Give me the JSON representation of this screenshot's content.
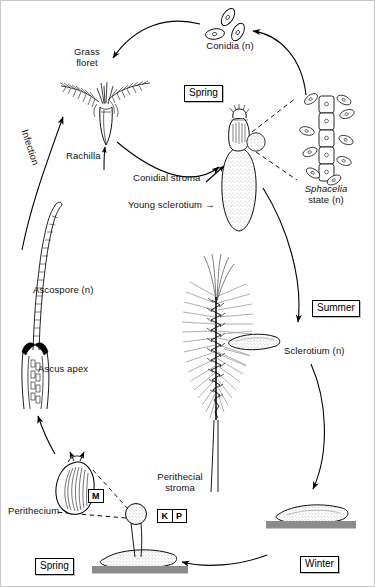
{
  "diagram": {
    "type": "biological-life-cycle",
    "colors": {
      "ink": "#000000",
      "soil_bar": "#8c8c8c",
      "stipple": "#ffffff",
      "awn_grey": "#9a9a9a",
      "background": "#ffffff"
    }
  },
  "seasons": [
    {
      "id": "spring-top",
      "label": "Spring",
      "x": 184,
      "y": 85
    },
    {
      "id": "summer",
      "label": "Summer",
      "x": 312,
      "y": 300
    },
    {
      "id": "winter",
      "label": "Winter",
      "x": 300,
      "y": 556
    },
    {
      "id": "spring-bottom",
      "label": "Spring",
      "x": 35,
      "y": 558
    }
  ],
  "labels": {
    "conidia": "Conidia (n)",
    "grass_floret": "Grass\nfloret",
    "rachilla": "Rachilla",
    "infection": "Infection",
    "conidial_stroma": "Conidial stroma",
    "young_sclerotium": "Young sclerotium",
    "sphacelia_genus": "Sphacelia",
    "sphacelia_state": "state (n)",
    "sclerotium": "Sclerotium (n)",
    "ascospore": "Ascospore (n)",
    "ascus_apex": "Ascus apex",
    "perithecium": "Perithecium",
    "perithecial_stroma": "Perithecial\nstroma"
  },
  "tags": {
    "meiosis": "M",
    "karyogamy": "K",
    "plasmogamy": "P"
  },
  "stages": [
    {
      "id": "conidia",
      "name": "Conidia (n)",
      "ploidy": "n",
      "season": "Spring"
    },
    {
      "id": "grass-floret",
      "name": "Grass floret",
      "ploidy": "",
      "season": "Spring"
    },
    {
      "id": "conidial-stroma",
      "name": "Conidial stroma",
      "ploidy": "",
      "season": "Spring"
    },
    {
      "id": "young-sclerotium",
      "name": "Young sclerotium",
      "ploidy": "",
      "season": "Spring"
    },
    {
      "id": "sphacelia-state",
      "name": "Sphacelia state (n)",
      "ploidy": "n",
      "season": "Spring"
    },
    {
      "id": "sclerotium",
      "name": "Sclerotium (n)",
      "ploidy": "n",
      "season": "Summer"
    },
    {
      "id": "overwintering",
      "name": "Sclerotium on soil",
      "ploidy": "n",
      "season": "Winter"
    },
    {
      "id": "perithecial-stroma",
      "name": "Perithecial stroma",
      "ploidy": "",
      "season": "Spring"
    },
    {
      "id": "perithecium",
      "name": "Perithecium",
      "ploidy": "",
      "season": "Spring"
    },
    {
      "id": "ascus-apex",
      "name": "Ascus apex",
      "ploidy": "",
      "season": "Spring"
    },
    {
      "id": "ascospore",
      "name": "Ascospore (n)",
      "ploidy": "n",
      "season": "Spring"
    }
  ],
  "arrows": [
    {
      "from": "conidia",
      "to": "grass-floret",
      "style": "solid"
    },
    {
      "from": "sphacelia-state",
      "to": "conidia",
      "style": "solid"
    },
    {
      "from": "grass-floret",
      "to": "conidial-stroma",
      "style": "solid"
    },
    {
      "from": "conidial-stroma",
      "to": "sclerotium",
      "style": "solid"
    },
    {
      "from": "sclerotium",
      "to": "overwintering",
      "style": "solid"
    },
    {
      "from": "overwintering",
      "to": "perithecial-stroma",
      "style": "solid"
    },
    {
      "from": "perithecial-stroma",
      "to": "perithecium",
      "style": "dashed"
    },
    {
      "from": "perithecium",
      "to": "ascus-apex",
      "style": "solid"
    },
    {
      "from": "ascospore",
      "to": "grass-floret",
      "style": "solid",
      "annotation": "Infection"
    },
    {
      "from": "stroma-detail",
      "to": "sphacelia-state",
      "style": "dashed"
    }
  ]
}
